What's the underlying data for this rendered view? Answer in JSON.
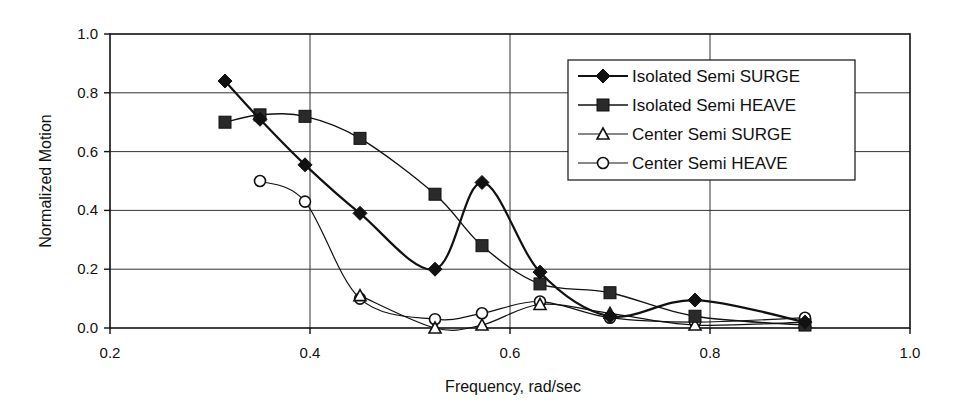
{
  "chart_data": {
    "type": "line",
    "title": "",
    "xlabel": "Frequency, rad/sec",
    "ylabel": "Normalized Motion",
    "xlim": [
      0.2,
      1.0
    ],
    "ylim": [
      0.0,
      1.0
    ],
    "xticks": [
      "0.2",
      "0.4",
      "0.6",
      "0.8",
      "1.0"
    ],
    "yticks": [
      "0.0",
      "0.2",
      "0.4",
      "0.6",
      "0.8",
      "1.0"
    ],
    "grid": true,
    "legend_position": "upper right (inside)",
    "smoothed": true,
    "series": [
      {
        "name": "Isolated Semi SURGE",
        "marker": "diamond-filled",
        "line_width": 2.2,
        "x": [
          0.315,
          0.35,
          0.395,
          0.45,
          0.525,
          0.572,
          0.63,
          0.7,
          0.785,
          0.895
        ],
        "y": [
          0.84,
          0.71,
          0.555,
          0.39,
          0.2,
          0.495,
          0.19,
          0.04,
          0.095,
          0.02
        ]
      },
      {
        "name": "Isolated Semi HEAVE",
        "marker": "square-filled",
        "line_width": 1.4,
        "x": [
          0.315,
          0.35,
          0.395,
          0.45,
          0.525,
          0.572,
          0.63,
          0.7,
          0.785,
          0.895
        ],
        "y": [
          0.7,
          0.725,
          0.72,
          0.645,
          0.455,
          0.28,
          0.15,
          0.12,
          0.04,
          0.01
        ]
      },
      {
        "name": "Center Semi SURGE",
        "marker": "triangle-open",
        "line_width": 1.2,
        "x": [
          0.45,
          0.525,
          0.572,
          0.63,
          0.7,
          0.785,
          0.895
        ],
        "y": [
          0.11,
          0.0,
          0.01,
          0.08,
          0.05,
          0.01,
          0.02
        ]
      },
      {
        "name": "Center Semi HEAVE",
        "marker": "circle-open",
        "line_width": 1.2,
        "x": [
          0.35,
          0.395,
          0.45,
          0.525,
          0.572,
          0.63,
          0.7,
          0.785,
          0.895
        ],
        "y": [
          0.5,
          0.43,
          0.1,
          0.03,
          0.05,
          0.09,
          0.035,
          0.02,
          0.035
        ]
      }
    ]
  },
  "colors": {
    "line": "#111111",
    "grid": "#333333",
    "background": "#ffffff"
  }
}
